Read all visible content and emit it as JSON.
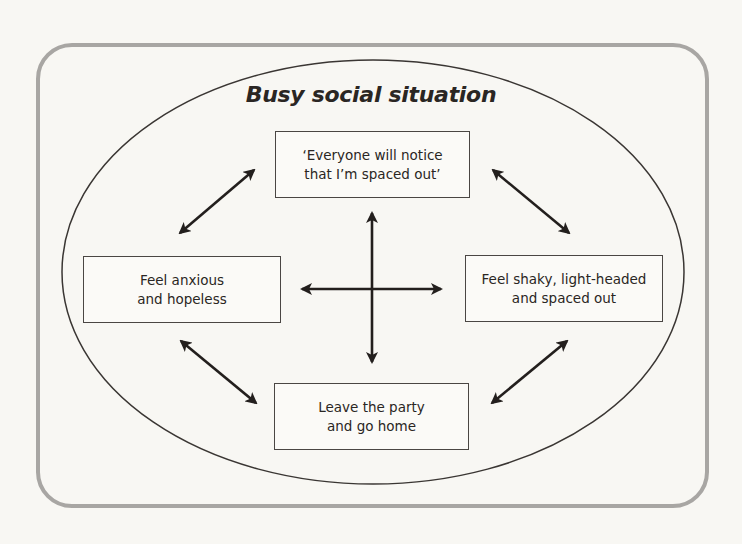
{
  "title": "Busy social situation",
  "boxes": {
    "top": {
      "line1": "‘Everyone will notice",
      "line2": "that I’m spaced out’"
    },
    "left": {
      "line1": "Feel anxious",
      "line2": "and hopeless"
    },
    "right": {
      "line1": "Feel shaky, light-headed",
      "line2": "and spaced out"
    },
    "bottom": {
      "line1": "Leave the party",
      "line2": "and go home"
    }
  },
  "arrows": [
    {
      "name": "top-left-arrow",
      "from": "left",
      "to": "top",
      "type": "bidirectional"
    },
    {
      "name": "top-right-arrow",
      "from": "top",
      "to": "right",
      "type": "bidirectional"
    },
    {
      "name": "bottom-left-arrow",
      "from": "left",
      "to": "bottom",
      "type": "bidirectional"
    },
    {
      "name": "bottom-right-arrow",
      "from": "bottom",
      "to": "right",
      "type": "bidirectional"
    },
    {
      "name": "center-vertical-arrow",
      "from": "top",
      "to": "bottom",
      "type": "bidirectional"
    },
    {
      "name": "center-horizontal-arrow",
      "from": "left",
      "to": "right",
      "type": "bidirectional"
    }
  ],
  "colors": {
    "frame": "#a8a6a3",
    "ellipse": "#3a3633",
    "arrow": "#231f1d",
    "text": "#2a2623",
    "background": "#f8f7f3"
  }
}
